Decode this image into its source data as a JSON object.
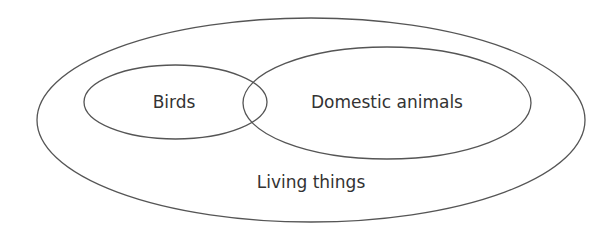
{
  "diagram": {
    "type": "venn",
    "sets": [
      {
        "id": "living",
        "label": "Living things",
        "shape": {
          "cx": 311,
          "cy": 120,
          "rx": 274,
          "ry": 102
        },
        "label_pos": {
          "x": 311,
          "y": 188
        }
      },
      {
        "id": "birds",
        "label": "Birds",
        "shape": {
          "cx": 175.5,
          "cy": 102,
          "rx": 91.5,
          "ry": 37
        },
        "label_pos": {
          "x": 174,
          "y": 108
        }
      },
      {
        "id": "domestic",
        "label": "Domestic animals",
        "shape": {
          "cx": 387,
          "cy": 103,
          "rx": 144,
          "ry": 56
        },
        "label_pos": {
          "x": 387,
          "y": 108
        }
      }
    ],
    "relationships": [
      {
        "type": "contains",
        "outer": "Living things",
        "inner": "Birds"
      },
      {
        "type": "contains",
        "outer": "Living things",
        "inner": "Domestic animals"
      },
      {
        "type": "overlaps",
        "a": "Birds",
        "b": "Domestic animals"
      }
    ],
    "colors": {
      "stroke": "#555555",
      "text": "#333333",
      "background": "#ffffff"
    }
  }
}
